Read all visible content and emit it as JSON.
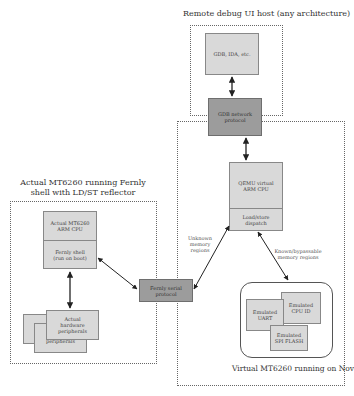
{
  "remote_host": {
    "title": "Remote debug UI host (any architecture)",
    "debugger_box": "GDB, IDA, etc."
  },
  "gdb_protocol": {
    "label_line1": "GDB network",
    "label_line2": "protocol"
  },
  "novena": {
    "title": "Virtual MT6260 running on Novena",
    "qemu_cpu_line1": "QEMU virtual",
    "qemu_cpu_line2": "ARM CPU",
    "dispatch_line1": "Load/store",
    "dispatch_line2": "dispatch",
    "known_regions_line1": "Known/bypassable",
    "known_regions_line2": "memory regions",
    "unknown_regions_line1": "Unknown",
    "unknown_regions_line2": "memory",
    "unknown_regions_line3": "regions",
    "emulated": {
      "uart_line1": "Emulated",
      "uart_line2": "UART",
      "cpuid_line1": "Emulated",
      "cpuid_line2": "CPU ID",
      "spiflash_line1": "Emulated",
      "spiflash_line2": "SPI FLASH"
    }
  },
  "actual_device": {
    "title_line1": "Actual MT6260 running Fernly",
    "title_line2": "shell with LD/ST reflector",
    "cpu_line1": "Actual MT6260",
    "cpu_line2": "ARM CPU",
    "shell_line1": "Fernly shell",
    "shell_line2": "(run on boot)",
    "peripherals_line1": "Actual",
    "peripherals_line2": "hardware",
    "peripherals_line3": "peripherals",
    "peripherals_back": "peripherals"
  },
  "fernly_protocol": {
    "label_line1": "Fernly serial",
    "label_line2": "protocol"
  },
  "colors": {
    "light_box": "#d9d9d9",
    "dark_box": "#9c9c9c",
    "border": "#888888",
    "arrow": "#222222"
  }
}
